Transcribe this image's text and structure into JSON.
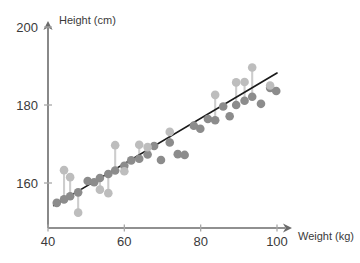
{
  "chart_data": {
    "type": "scatter",
    "title": "",
    "xlabel": "Weight (kg)",
    "ylabel": "Height (cm)",
    "xlim": [
      40,
      102
    ],
    "ylim": [
      148,
      200
    ],
    "xticks": [
      40,
      60,
      80,
      100
    ],
    "yticks": [
      160,
      180,
      200
    ],
    "grid": false,
    "legend": "none",
    "annotation": "Scatter plot of height versus weight with fitted least-squares regression line; vertical segments show residuals from each observed point to its fitted value on the line.",
    "series": [
      {
        "name": "Observed points",
        "color": "#bdbdbd",
        "points": [
          {
            "x": 42.3,
            "y": 154.9
          },
          {
            "x": 44.2,
            "y": 163.3
          },
          {
            "x": 45.8,
            "y": 161.5
          },
          {
            "x": 47.9,
            "y": 152.4
          },
          {
            "x": 50.4,
            "y": 160.5
          },
          {
            "x": 52.1,
            "y": 160.2
          },
          {
            "x": 53.6,
            "y": 158.3
          },
          {
            "x": 55.8,
            "y": 157.4
          },
          {
            "x": 57.6,
            "y": 169.7
          },
          {
            "x": 60.0,
            "y": 163.0
          },
          {
            "x": 61.8,
            "y": 165.8
          },
          {
            "x": 63.9,
            "y": 169.8
          },
          {
            "x": 66.1,
            "y": 169.2
          },
          {
            "x": 67.8,
            "y": 169.5
          },
          {
            "x": 69.6,
            "y": 165.9
          },
          {
            "x": 71.9,
            "y": 173.1
          },
          {
            "x": 74.0,
            "y": 167.4
          },
          {
            "x": 75.8,
            "y": 167.2
          },
          {
            "x": 78.2,
            "y": 174.7
          },
          {
            "x": 79.9,
            "y": 174.2
          },
          {
            "x": 81.9,
            "y": 176.4
          },
          {
            "x": 83.8,
            "y": 182.6
          },
          {
            "x": 85.9,
            "y": 179.6
          },
          {
            "x": 87.6,
            "y": 177.1
          },
          {
            "x": 89.3,
            "y": 185.8
          },
          {
            "x": 91.5,
            "y": 185.9
          },
          {
            "x": 93.5,
            "y": 189.6
          },
          {
            "x": 95.8,
            "y": 180.3
          },
          {
            "x": 98.2,
            "y": 185.0
          },
          {
            "x": 99.8,
            "y": 183.6
          }
        ]
      },
      {
        "name": "Fitted points on regression line",
        "color": "#8c8c8c",
        "points": [
          {
            "x": 42.3,
            "y": 154.9
          },
          {
            "x": 44.2,
            "y": 155.8
          },
          {
            "x": 45.8,
            "y": 156.6
          },
          {
            "x": 47.9,
            "y": 157.6
          },
          {
            "x": 50.4,
            "y": 160.5
          },
          {
            "x": 52.1,
            "y": 160.2
          },
          {
            "x": 53.6,
            "y": 161.3
          },
          {
            "x": 55.8,
            "y": 162.3
          },
          {
            "x": 57.6,
            "y": 163.2
          },
          {
            "x": 60.0,
            "y": 164.4
          },
          {
            "x": 61.8,
            "y": 165.8
          },
          {
            "x": 63.9,
            "y": 166.2
          },
          {
            "x": 66.1,
            "y": 167.3
          },
          {
            "x": 67.8,
            "y": 169.5
          },
          {
            "x": 69.6,
            "y": 165.9
          },
          {
            "x": 71.9,
            "y": 170.4
          },
          {
            "x": 74.0,
            "y": 167.4
          },
          {
            "x": 75.8,
            "y": 167.2
          },
          {
            "x": 78.2,
            "y": 174.7
          },
          {
            "x": 79.9,
            "y": 173.9
          },
          {
            "x": 81.9,
            "y": 176.4
          },
          {
            "x": 83.8,
            "y": 176.1
          },
          {
            "x": 85.9,
            "y": 179.6
          },
          {
            "x": 87.6,
            "y": 177.1
          },
          {
            "x": 89.3,
            "y": 180.0
          },
          {
            "x": 91.5,
            "y": 181.1
          },
          {
            "x": 93.5,
            "y": 182.1
          },
          {
            "x": 95.8,
            "y": 180.3
          },
          {
            "x": 98.2,
            "y": 184.4
          },
          {
            "x": 99.8,
            "y": 183.6
          }
        ]
      }
    ],
    "fit_line": {
      "name": "Least-squares regression line",
      "color": "#1a1a1a",
      "x_start": 41.5,
      "y_start": 154.2,
      "x_end": 100.0,
      "y_end": 188.2
    }
  }
}
